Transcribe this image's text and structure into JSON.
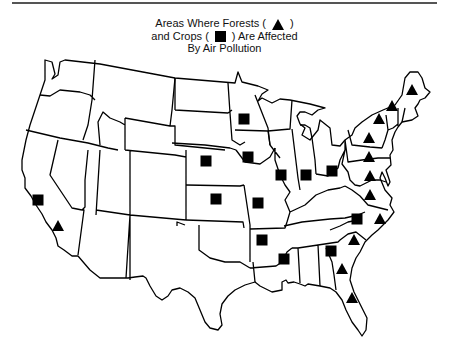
{
  "title": {
    "line1_prefix": "Areas Where Forests (",
    "line1_suffix": ")",
    "line2_prefix": "and Crops (",
    "line2_suffix": ") Are Affected",
    "line3": "By Air Pollution"
  },
  "legend": {
    "forests": {
      "label": "Forests",
      "symbol": "triangle-icon"
    },
    "crops": {
      "label": "Crops",
      "symbol": "square-icon"
    }
  },
  "colors": {
    "ink": "#000000",
    "background": "#ffffff",
    "rule": "#555555"
  },
  "markers": {
    "crops": [
      {
        "region": "California (north)",
        "x": 38,
        "y": 200
      },
      {
        "region": "Minnesota",
        "x": 244,
        "y": 119
      },
      {
        "region": "Nebraska",
        "x": 206,
        "y": 161
      },
      {
        "region": "Iowa",
        "x": 248,
        "y": 157
      },
      {
        "region": "Illinois",
        "x": 281,
        "y": 175
      },
      {
        "region": "Indiana",
        "x": 306,
        "y": 175
      },
      {
        "region": "Ohio",
        "x": 332,
        "y": 171
      },
      {
        "region": "Kansas",
        "x": 216,
        "y": 199
      },
      {
        "region": "Missouri",
        "x": 258,
        "y": 203
      },
      {
        "region": "Arkansas",
        "x": 262,
        "y": 240
      },
      {
        "region": "Mississippi",
        "x": 284,
        "y": 259
      },
      {
        "region": "North Carolina (west)",
        "x": 357,
        "y": 219
      },
      {
        "region": "Georgia (north)",
        "x": 331,
        "y": 251
      }
    ],
    "forests": [
      {
        "region": "California (south)",
        "x": 58,
        "y": 226
      },
      {
        "region": "Maine",
        "x": 412,
        "y": 90
      },
      {
        "region": "Vermont / New Hampshire",
        "x": 392,
        "y": 106
      },
      {
        "region": "New York (north)",
        "x": 379,
        "y": 119
      },
      {
        "region": "New York (south)",
        "x": 369,
        "y": 138
      },
      {
        "region": "Pennsylvania",
        "x": 369,
        "y": 157
      },
      {
        "region": "Maryland / West Virginia",
        "x": 370,
        "y": 176
      },
      {
        "region": "Virginia",
        "x": 370,
        "y": 195
      },
      {
        "region": "North Carolina (east)",
        "x": 380,
        "y": 219
      },
      {
        "region": "South Carolina",
        "x": 354,
        "y": 240
      },
      {
        "region": "Georgia (south)",
        "x": 342,
        "y": 269
      },
      {
        "region": "Florida",
        "x": 352,
        "y": 298
      }
    ]
  }
}
